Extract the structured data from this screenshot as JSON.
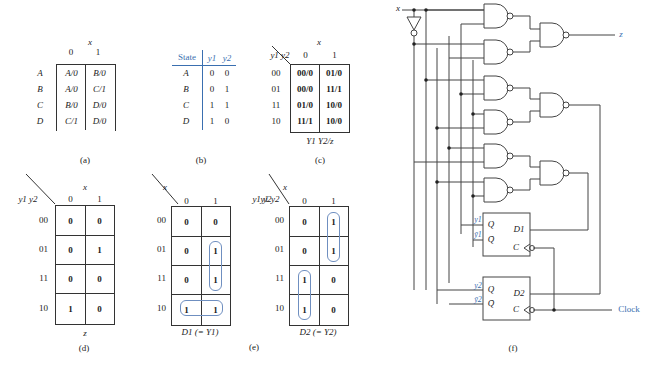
{
  "panel_a": {
    "caption": "(a)",
    "col_var": "x",
    "cols": [
      "0",
      "1"
    ],
    "rows": [
      {
        "state": "A",
        "x0": "A/0",
        "x1": "B/0"
      },
      {
        "state": "B",
        "x0": "A/0",
        "x1": "C/1"
      },
      {
        "state": "C",
        "x0": "B/0",
        "x1": "D/0"
      },
      {
        "state": "D",
        "x0": "C/1",
        "x1": "D/0"
      }
    ]
  },
  "panel_b": {
    "caption": "(b)",
    "headers": [
      "State",
      "y1",
      "y2"
    ],
    "rows": [
      {
        "state": "A",
        "y1": "0",
        "y2": "0"
      },
      {
        "state": "B",
        "y1": "0",
        "y2": "1"
      },
      {
        "state": "C",
        "y1": "1",
        "y2": "1"
      },
      {
        "state": "D",
        "y1": "1",
        "y2": "0"
      }
    ]
  },
  "panel_c": {
    "caption": "(c)",
    "row_var": "y1 y2",
    "col_var": "x",
    "cols": [
      "0",
      "1"
    ],
    "row_labels": [
      "00",
      "01",
      "11",
      "10"
    ],
    "cells": [
      [
        "00/0",
        "01/0"
      ],
      [
        "00/0",
        "11/1"
      ],
      [
        "01/0",
        "10/0"
      ],
      [
        "11/1",
        "10/0"
      ]
    ],
    "footer": "Y1 Y2/z"
  },
  "panel_d": {
    "caption": "(d)",
    "row_var": "y1 y2",
    "col_var": "x",
    "cols": [
      "0",
      "1"
    ],
    "row_labels": [
      "00",
      "01",
      "11",
      "10"
    ],
    "cells": [
      [
        "0",
        "0"
      ],
      [
        "0",
        "1"
      ],
      [
        "0",
        "0"
      ],
      [
        "1",
        "0"
      ]
    ],
    "footer": "z"
  },
  "panel_e": {
    "caption": "(e)",
    "maps": [
      {
        "row_var": "y1 y2",
        "col_var": "x",
        "cols": [
          "0",
          "1"
        ],
        "row_labels": [
          "00",
          "01",
          "11",
          "10"
        ],
        "cells": [
          [
            "0",
            "0"
          ],
          [
            "0",
            "1"
          ],
          [
            "0",
            "1"
          ],
          [
            "1",
            "1"
          ]
        ],
        "footer": "D1 (= Y1)"
      },
      {
        "row_var": "y1 y2",
        "col_var": "x",
        "cols": [
          "0",
          "1"
        ],
        "row_labels": [
          "00",
          "01",
          "11",
          "10"
        ],
        "cells": [
          [
            "0",
            "1"
          ],
          [
            "0",
            "1"
          ],
          [
            "1",
            "0"
          ],
          [
            "1",
            "0"
          ]
        ],
        "footer": "D2 (= Y2)"
      }
    ]
  },
  "panel_f": {
    "caption": "(f)",
    "input_label": "x",
    "output_label": "z",
    "clock_label": "Clock",
    "ff1": {
      "q": "Q",
      "qbar": "Q̄",
      "d": "D1",
      "c": "C",
      "y": "y1",
      "ybar": "ȳ1"
    },
    "ff2": {
      "q": "Q",
      "qbar": "Q̄",
      "d": "D2",
      "c": "C",
      "y": "y2",
      "ybar": "ȳ2"
    }
  },
  "colors": {
    "accent": "#3a6fb0",
    "line": "#333333"
  }
}
